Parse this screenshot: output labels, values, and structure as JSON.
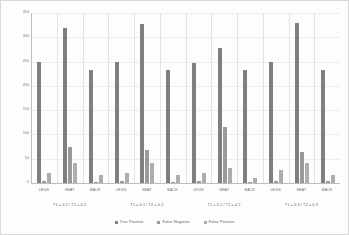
{
  "chart_data": {
    "type": "bar",
    "title": "",
    "xlabel": "",
    "ylabel": "",
    "ylim": [
      0,
      350
    ],
    "yticks": [
      0,
      50,
      100,
      150,
      200,
      250,
      300,
      350
    ],
    "ytick_labels": [
      "0",
      "50",
      "100",
      "150",
      "200",
      "250",
      "300",
      "350"
    ],
    "grid": true,
    "legend_position": "bottom",
    "legend": [
      {
        "name": "True Positive",
        "color": "#7f7f7f"
      },
      {
        "name": "False Negative",
        "color": "#9a9a9a"
      },
      {
        "name": "False Positive",
        "color": "#adadad"
      }
    ],
    "categories": [
      "LEGS",
      "SEAT",
      "BACK"
    ],
    "groups": [
      {
        "label": "T1 = 0.2 / T2 = 0.1",
        "categories": [
          "LEGS",
          "SEAT",
          "BACK"
        ],
        "series": [
          {
            "name": "True Positive",
            "values": [
              250,
              320,
              233
            ]
          },
          {
            "name": "False Negative",
            "values": [
              4,
              75,
              3
            ]
          },
          {
            "name": "False Positive",
            "values": [
              21,
              41,
              17
            ]
          }
        ]
      },
      {
        "label": "T1 = 0.1 / T2 = 0.2",
        "categories": [
          "LEGS",
          "SEAT",
          "BACK"
        ],
        "series": [
          {
            "name": "True Positive",
            "values": [
              249,
              328,
              233
            ]
          },
          {
            "name": "False Negative",
            "values": [
              4,
              69,
              3
            ]
          },
          {
            "name": "False Positive",
            "values": [
              21,
              41,
              17
            ]
          }
        ]
      },
      {
        "label": "T1 = 0.1 / T2 = 0.1",
        "categories": [
          "LEGS",
          "SEAT",
          "BACK"
        ],
        "series": [
          {
            "name": "True Positive",
            "values": [
              248,
              278,
              233
            ]
          },
          {
            "name": "False Negative",
            "values": [
              5,
              115,
              3
            ]
          },
          {
            "name": "False Positive",
            "values": [
              20,
              30,
              10
            ]
          }
        ]
      },
      {
        "label": "T1 = 0.3 / T2 = 0.3",
        "categories": [
          "LEGS",
          "SEAT",
          "BACK"
        ],
        "series": [
          {
            "name": "True Positive",
            "values": [
              249,
              329,
              233
            ]
          },
          {
            "name": "False Negative",
            "values": [
              4,
              64,
              4
            ]
          },
          {
            "name": "False Positive",
            "values": [
              26,
              41,
              17
            ]
          }
        ]
      }
    ]
  }
}
